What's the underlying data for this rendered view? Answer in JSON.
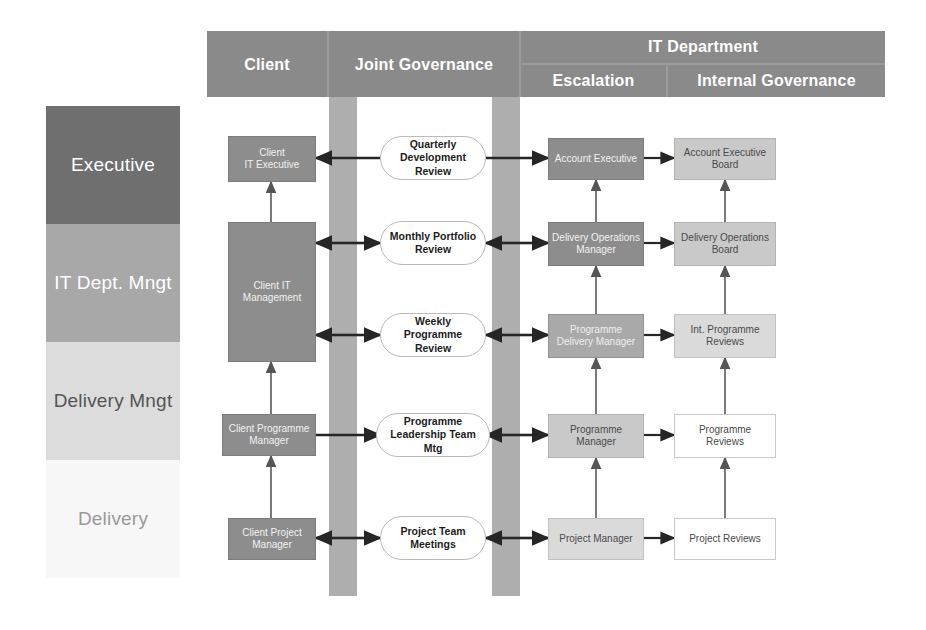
{
  "diagram": {
    "legend": {
      "tiers": [
        {
          "label": "Executive",
          "color": "#6f6f6f"
        },
        {
          "label": "IT Dept.\nMngt",
          "color": "#a8a8a8"
        },
        {
          "label": "Delivery\nMngt",
          "color": "#dcdcdc"
        },
        {
          "label": "Delivery",
          "color": "#f7f7f7"
        }
      ]
    },
    "header": {
      "band_color": "#8a8a8a",
      "columns": [
        {
          "label": "Client"
        },
        {
          "label": "Joint Governance"
        },
        {
          "label": "IT Department"
        }
      ],
      "subcolumns": [
        {
          "label": "Escalation"
        },
        {
          "label": "Internal Governance"
        }
      ]
    },
    "columns": {
      "client": {
        "nodes": [
          {
            "label": "Client\nIT Executive",
            "shade": "node-dark"
          },
          {
            "label": "Client IT\nManagement",
            "shade": "node-dark"
          },
          {
            "label": "Client Programme\nManager",
            "shade": "node-dark"
          },
          {
            "label": "Client Project\nManager",
            "shade": "node-dark"
          }
        ]
      },
      "joint_governance": {
        "nodes": [
          {
            "label": "Quarterly\nDevelopment Review"
          },
          {
            "label": "Monthly Portfolio\nReview"
          },
          {
            "label": "Weekly Programme\nReview"
          },
          {
            "label": "Programme\nLeadership Team Mtg"
          },
          {
            "label": "Project Team\nMeetings"
          }
        ]
      },
      "escalation": {
        "nodes": [
          {
            "label": "Account Executive",
            "shade": "node-dark"
          },
          {
            "label": "Delivery Operations\nManager",
            "shade": "node-dark"
          },
          {
            "label": "Programme\nDelivery Manager",
            "shade": "node-mid"
          },
          {
            "label": "Programme\nManager",
            "shade": "node-light"
          },
          {
            "label": "Project Manager",
            "shade": "node-lighter"
          }
        ]
      },
      "internal_governance": {
        "nodes": [
          {
            "label": "Account Executive\nBoard",
            "shade": "node-light"
          },
          {
            "label": "Delivery Operations\nBoard",
            "shade": "node-light"
          },
          {
            "label": "Int. Programme\nReviews",
            "shade": "node-lighter"
          },
          {
            "label": "Programme\nReviews",
            "shade": "node-white"
          },
          {
            "label": "Project Reviews",
            "shade": "node-white"
          }
        ]
      }
    }
  }
}
